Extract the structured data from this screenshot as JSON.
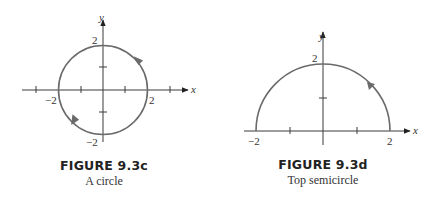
{
  "figures": [
    {
      "id": "9.3c",
      "title": "FIGURE 9.3c",
      "subtitle": "A circle",
      "x_axis_label": "x",
      "y_axis_label": "y",
      "tick_labels": {
        "x_neg": "−2",
        "x_pos": "2",
        "y_pos": "2",
        "y_neg": "−2"
      },
      "curve": "circle x^2 + y^2 = 4, counterclockwise orientation",
      "arrows": [
        "upper-right quadrant pointing up-left",
        "lower-left quadrant pointing down-right"
      ]
    },
    {
      "id": "9.3d",
      "title": "FIGURE 9.3d",
      "subtitle": "Top semicircle",
      "x_axis_label": "x",
      "y_axis_label": "y",
      "tick_labels": {
        "x_neg": "−2",
        "x_pos": "2",
        "y_pos": "2"
      },
      "curve": "top semicircle y = sqrt(4 - x^2), from (2,0) to (-2,0)",
      "arrows": [
        "upper-right arc pointing up-left"
      ]
    }
  ],
  "colors": {
    "curve": "#6a6a6a",
    "axis": "#3a3a3a",
    "text": "#333333"
  }
}
